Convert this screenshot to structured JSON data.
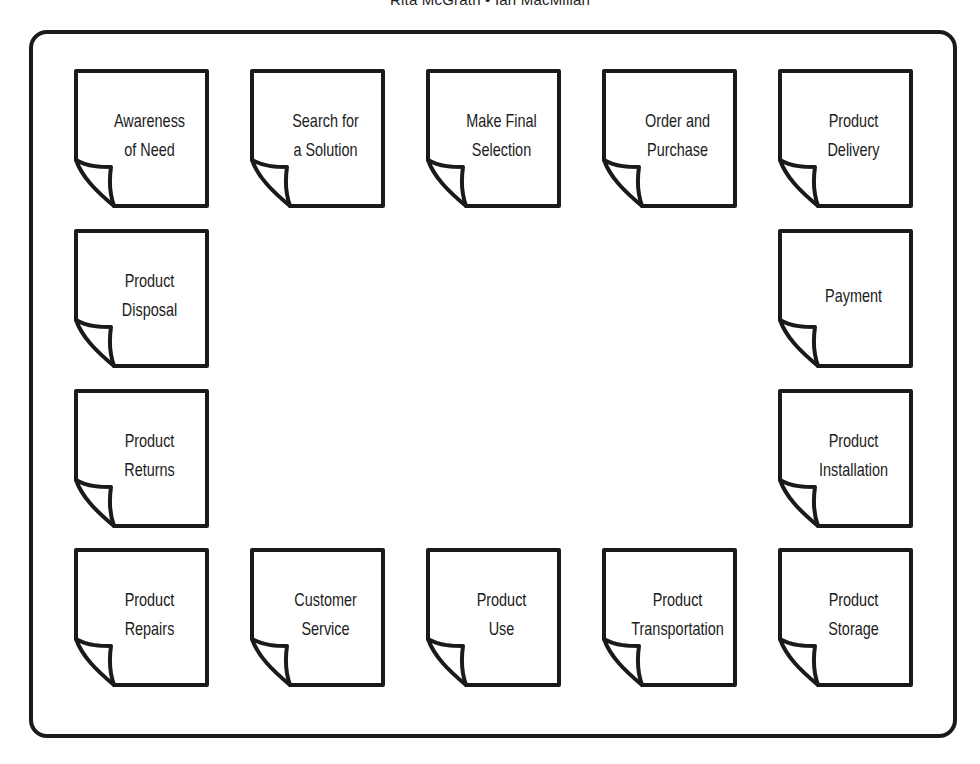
{
  "header": {
    "authors": "Rita McGrath • Ian MacMillan"
  },
  "diagram": {
    "type": "consumption chain",
    "stroke_color": "#1a1a1a",
    "notes": [
      {
        "id": "awareness-of-need",
        "label": "Awareness\nof Need",
        "x": 74,
        "y": 69
      },
      {
        "id": "search-for-a-solution",
        "label": "Search for\na Solution",
        "x": 250,
        "y": 69
      },
      {
        "id": "make-final-selection",
        "label": "Make Final\nSelection",
        "x": 426,
        "y": 69
      },
      {
        "id": "order-and-purchase",
        "label": "Order and\nPurchase",
        "x": 602,
        "y": 69
      },
      {
        "id": "product-delivery",
        "label": "Product\nDelivery",
        "x": 778,
        "y": 69
      },
      {
        "id": "payment",
        "label": "Payment",
        "x": 778,
        "y": 229
      },
      {
        "id": "product-installation",
        "label": "Product\nInstallation",
        "x": 778,
        "y": 389
      },
      {
        "id": "product-storage",
        "label": "Product\nStorage",
        "x": 778,
        "y": 548
      },
      {
        "id": "product-transportation",
        "label": "Product\nTransportation",
        "x": 602,
        "y": 548
      },
      {
        "id": "product-use",
        "label": "Product\nUse",
        "x": 426,
        "y": 548
      },
      {
        "id": "customer-service",
        "label": "Customer\nService",
        "x": 250,
        "y": 548
      },
      {
        "id": "product-repairs",
        "label": "Product\nRepairs",
        "x": 74,
        "y": 548
      },
      {
        "id": "product-returns",
        "label": "Product\nReturns",
        "x": 74,
        "y": 389
      },
      {
        "id": "product-disposal",
        "label": "Product\nDisposal",
        "x": 74,
        "y": 229
      }
    ]
  }
}
